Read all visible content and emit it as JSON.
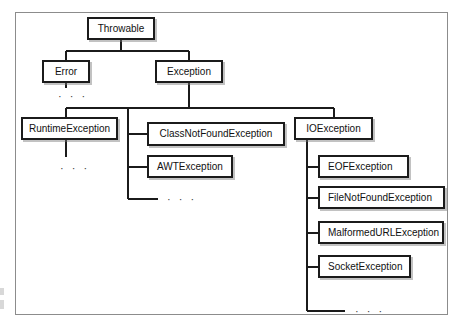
{
  "diagram": {
    "type": "class-hierarchy-tree",
    "border_color": "#8c8c8c",
    "node_border_color": "#1b1b1b",
    "line_color": "#1b1b1b",
    "background": "#ffffff",
    "ellipsis": "· · ·",
    "nodes": [
      {
        "id": "throwable",
        "label": "Throwable",
        "level": 0,
        "x": 87,
        "y": 17,
        "w": 68,
        "h": 23,
        "align": "center"
      },
      {
        "id": "error",
        "label": "Error",
        "level": 1,
        "x": 42,
        "y": 60,
        "w": 48,
        "h": 23,
        "align": "center"
      },
      {
        "id": "exception",
        "label": "Exception",
        "level": 1,
        "x": 155,
        "y": 60,
        "w": 68,
        "h": 23,
        "align": "center"
      },
      {
        "id": "runtimeexception",
        "label": "RuntimeException",
        "level": 2,
        "x": 21,
        "y": 117,
        "w": 97,
        "h": 23,
        "align": "center"
      },
      {
        "id": "classnotfoundexception",
        "label": "ClassNotFoundException",
        "level": 2,
        "x": 147,
        "y": 122,
        "w": 138,
        "h": 24,
        "align": "center"
      },
      {
        "id": "awtexception",
        "label": "AWTException",
        "level": 2,
        "x": 147,
        "y": 155,
        "w": 86,
        "h": 23,
        "align": "lead"
      },
      {
        "id": "ioexception",
        "label": "IOException",
        "level": 2,
        "x": 294,
        "y": 117,
        "w": 79,
        "h": 23,
        "align": "center"
      },
      {
        "id": "eofexception",
        "label": "EOFException",
        "level": 3,
        "x": 318,
        "y": 155,
        "w": 91,
        "h": 23,
        "align": "lead"
      },
      {
        "id": "filenotfoundexception",
        "label": "FileNotFoundException",
        "level": 3,
        "x": 318,
        "y": 186,
        "w": 127,
        "h": 23,
        "align": "lead"
      },
      {
        "id": "malformedurlexception",
        "label": "MalformedURLException",
        "level": 3,
        "x": 318,
        "y": 221,
        "w": 126,
        "h": 23,
        "align": "lead"
      },
      {
        "id": "socketexception",
        "label": "SocketException",
        "level": 3,
        "x": 318,
        "y": 255,
        "w": 93,
        "h": 23,
        "align": "lead"
      }
    ],
    "edges": [
      {
        "from": "throwable",
        "to": "error"
      },
      {
        "from": "throwable",
        "to": "exception"
      },
      {
        "from": "exception",
        "to": "runtimeexception"
      },
      {
        "from": "exception",
        "to": "classnotfoundexception"
      },
      {
        "from": "exception",
        "to": "awtexception"
      },
      {
        "from": "exception",
        "to": "ioexception"
      },
      {
        "from": "ioexception",
        "to": "eofexception"
      },
      {
        "from": "ioexception",
        "to": "filenotfoundexception"
      },
      {
        "from": "ioexception",
        "to": "malformedurlexception"
      },
      {
        "from": "ioexception",
        "to": "socketexception"
      }
    ],
    "continuations": [
      {
        "id": "error-more",
        "under": "error",
        "x": 58,
        "y": 91
      },
      {
        "id": "runtime-more",
        "under": "runtimeexception",
        "x": 60,
        "y": 163
      },
      {
        "id": "exception-more",
        "under": "exception",
        "x": 167,
        "y": 194
      },
      {
        "id": "io-more",
        "under": "ioexception",
        "x": 355,
        "y": 306
      }
    ]
  }
}
